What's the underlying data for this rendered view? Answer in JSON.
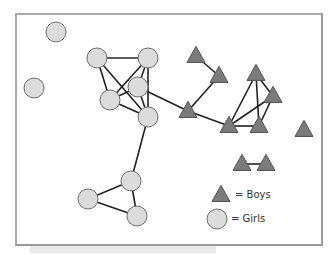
{
  "legend": {
    "boys_label": "= Boys",
    "girls_label": "= Girls"
  },
  "colors": {
    "boy_fill": "#7b7b7b",
    "boy_stroke": "#555555",
    "girl_fill": "#dcdcdc",
    "girl_stroke": "#6e6e6e",
    "edge": "#222222",
    "frame": "#9a9a9a"
  },
  "nodes": [
    {
      "id": "G1",
      "type": "girl",
      "x": 56,
      "y": 32
    },
    {
      "id": "G2",
      "type": "girl",
      "x": 34,
      "y": 88
    },
    {
      "id": "G3",
      "type": "girl",
      "x": 97,
      "y": 58
    },
    {
      "id": "G4",
      "type": "girl",
      "x": 148,
      "y": 58
    },
    {
      "id": "G5",
      "type": "girl",
      "x": 138,
      "y": 87
    },
    {
      "id": "G6",
      "type": "girl",
      "x": 110,
      "y": 100
    },
    {
      "id": "G7",
      "type": "girl",
      "x": 148,
      "y": 117
    },
    {
      "id": "G8",
      "type": "girl",
      "x": 131,
      "y": 181
    },
    {
      "id": "G9",
      "type": "girl",
      "x": 88,
      "y": 199
    },
    {
      "id": "G10",
      "type": "girl",
      "x": 137,
      "y": 216
    },
    {
      "id": "B1",
      "type": "boy",
      "x": 196,
      "y": 56
    },
    {
      "id": "B2",
      "type": "boy",
      "x": 219,
      "y": 76
    },
    {
      "id": "B3",
      "type": "boy",
      "x": 256,
      "y": 74
    },
    {
      "id": "B4",
      "type": "boy",
      "x": 273,
      "y": 96
    },
    {
      "id": "B5",
      "type": "boy",
      "x": 188,
      "y": 111
    },
    {
      "id": "B6",
      "type": "boy",
      "x": 229,
      "y": 126
    },
    {
      "id": "B7",
      "type": "boy",
      "x": 259,
      "y": 126
    },
    {
      "id": "B8",
      "type": "boy",
      "x": 304,
      "y": 130
    },
    {
      "id": "B9",
      "type": "boy",
      "x": 242,
      "y": 164
    },
    {
      "id": "B10",
      "type": "boy",
      "x": 266,
      "y": 164
    }
  ],
  "edges": [
    [
      "G3",
      "G4"
    ],
    [
      "G3",
      "G6"
    ],
    [
      "G3",
      "G7"
    ],
    [
      "G4",
      "G6"
    ],
    [
      "G4",
      "G5"
    ],
    [
      "G4",
      "G7"
    ],
    [
      "G5",
      "G6"
    ],
    [
      "G5",
      "G7"
    ],
    [
      "G6",
      "G7"
    ],
    [
      "G5",
      "B5"
    ],
    [
      "G7",
      "G8"
    ],
    [
      "G8",
      "G9"
    ],
    [
      "G8",
      "G10"
    ],
    [
      "G9",
      "G10"
    ],
    [
      "B1",
      "B2"
    ],
    [
      "B2",
      "B5"
    ],
    [
      "B5",
      "B6"
    ],
    [
      "B6",
      "B3"
    ],
    [
      "B6",
      "B4"
    ],
    [
      "B6",
      "B7"
    ],
    [
      "B3",
      "B7"
    ],
    [
      "B3",
      "B4"
    ],
    [
      "B4",
      "B7"
    ],
    [
      "B9",
      "B10"
    ]
  ],
  "legend_symbols": {
    "boy": {
      "x": 221,
      "y": 195
    },
    "girl": {
      "x": 217,
      "y": 219
    }
  }
}
